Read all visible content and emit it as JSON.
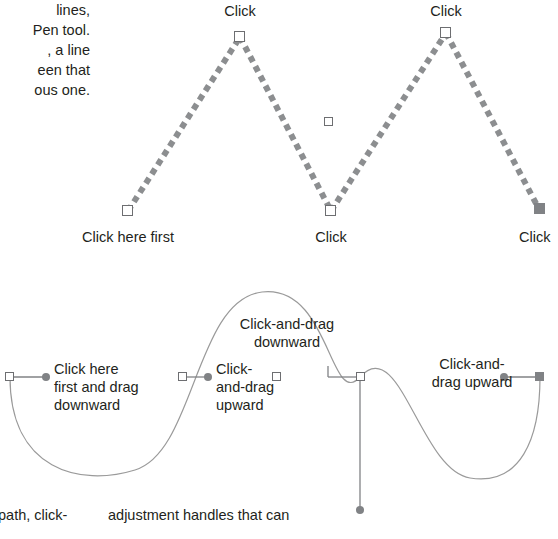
{
  "page": {
    "width": 558,
    "height": 539,
    "background": "#ffffff",
    "ink": "#231f20",
    "line_gray": "#808285",
    "anchor_stroke": "#6d6e71"
  },
  "body_text": {
    "left_column_top": "lines,\nPen tool.\n, a line\neen that\nous one.",
    "bottom_left": "path, click-",
    "bottom_middle": "adjustment handles that can"
  },
  "figure_top": {
    "labels": {
      "click_peak_left": "Click",
      "click_peak_right": "Click",
      "click_here_first": "Click here first",
      "click_valley": "Click",
      "click_right_end": "Click"
    }
  },
  "figure_bottom": {
    "labels": {
      "click_here_first_and_drag_downward": "Click here\nfirst and drag\ndownward",
      "click_and_drag_upward": "Click-\nand-drag\nupward",
      "click_and_drag_downward": "Click-and-drag\ndownward",
      "click_and_drag_upward_right": "Click-and-\ndrag upward"
    }
  }
}
